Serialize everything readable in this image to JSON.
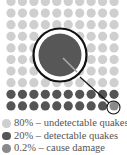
{
  "colors": {
    "undetectable": "#cfcfcf",
    "detectable": "#555555",
    "damage": "#8a8a8a",
    "magnifier_ring": "#111111",
    "magnifier_fill": "#575757",
    "magnifier_glint": "#a8a8a8"
  },
  "grid": {
    "columns": 10,
    "rows": 10,
    "origin_x": 11,
    "origin_y": 1.5,
    "step_x": 11.45,
    "step_y": 11.6,
    "dot_radius": 4.6,
    "light_rows": 8,
    "dark_rows": 2,
    "highlight_index": 99
  },
  "magnifier": {
    "cx": 60,
    "cy": 55,
    "ring_r": 26.5,
    "inner_r": 21.5,
    "handle_from": [
      80,
      77
    ],
    "handle_to": [
      109,
      103
    ],
    "target_cx": 113.5,
    "target_cy": 107.5,
    "target_r": 6.5
  },
  "legend": [
    {
      "label": "80% – undetectable quakes",
      "color_key": "undetectable"
    },
    {
      "label": "20% – detectable quakes",
      "color_key": "detectable"
    },
    {
      "label": "0.2% – cause damage",
      "color_key": "damage"
    }
  ]
}
